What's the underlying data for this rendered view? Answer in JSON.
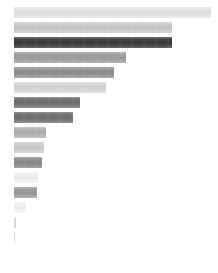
{
  "chart_data": {
    "type": "bar",
    "orientation": "horizontal",
    "title": "",
    "subtitle": "",
    "xlabel": "",
    "ylabel": "",
    "legend": null,
    "legend_position": "none",
    "grid": false,
    "axis_visible": false,
    "tick_labels_visible": false,
    "data_labels_visible": false,
    "background_color": "#ffffff",
    "xlim": [
      0,
      200
    ],
    "categories": [
      "",
      "",
      "",
      "",
      "",
      "",
      "",
      "",
      "",
      "",
      "",
      "",
      "",
      "",
      "",
      ""
    ],
    "values": [
      197,
      158,
      158,
      112,
      100,
      92,
      66,
      59,
      32,
      30,
      28,
      24,
      23,
      12,
      2,
      1
    ],
    "bar_colors": [
      "#e3e3e3",
      "#c9c9c9",
      "#3a3a3a",
      "#9e9e9e",
      "#8f8f8f",
      "#d6d6d6",
      "#6e6e6e",
      "#6e6e6e",
      "#b0b0b0",
      "#cccccc",
      "#8a8a8a",
      "#f0f0f0",
      "#9a9a9a",
      "#f2f2f2",
      "#d8d8d8",
      "#d8d8d8"
    ],
    "bar_pixel_widths": [
      197,
      158,
      158,
      112,
      100,
      92,
      66,
      59,
      32,
      30,
      28,
      24,
      23,
      12,
      2,
      1
    ],
    "bar_pixel_height": 11,
    "bar_pixel_gap": 4,
    "plot_origin_x": 14,
    "plot_origin_y": 7
  },
  "meta": {
    "canvas_width": 218,
    "canvas_height": 273,
    "bar_count": 16,
    "accent_color": "#3a3a3a"
  }
}
